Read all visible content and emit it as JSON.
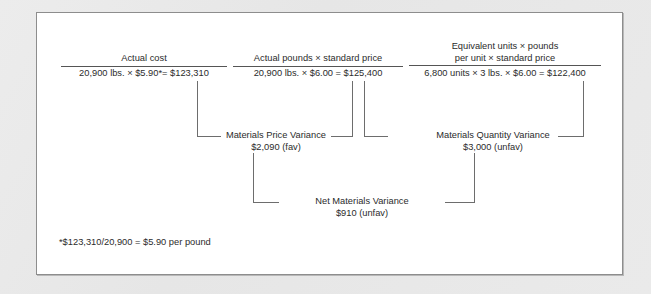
{
  "diagram": {
    "columns": [
      {
        "id": "actual-cost",
        "numerator": "Actual cost",
        "denominator": "20,900 lbs. × $5.90*= $123,310"
      },
      {
        "id": "actual-pounds-standard-price",
        "numerator": "Actual pounds × standard price",
        "denominator": "20,900 lbs. × $6.00 = $125,400"
      },
      {
        "id": "equivalent-units-standard",
        "numerator_line1": "Equivalent units × pounds",
        "numerator_line2": "per unit × standard price",
        "denominator": "6,800 units × 3 lbs. × $6.00 = $122,400"
      }
    ],
    "variances": [
      {
        "id": "materials-price-variance",
        "name": "Materials Price Variance",
        "amount": "$2,090 (fav)"
      },
      {
        "id": "materials-quantity-variance",
        "name": "Materials Quantity Variance",
        "amount": "$3,000 (unfav)"
      },
      {
        "id": "net-materials-variance",
        "name": "Net Materials Variance",
        "amount": "$910 (unfav)"
      }
    ],
    "footnote": "*$123,310/20,900 = $5.90 per pound",
    "colors": {
      "panel_background": "#ffffff",
      "page_background": "#e9e9e9",
      "text": "#2b2b2b",
      "rule": "#6d6d6d",
      "border": "#8d8d8d"
    }
  }
}
